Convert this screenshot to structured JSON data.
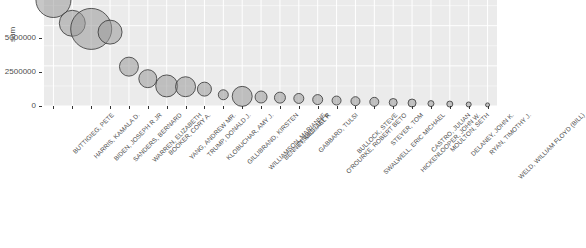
{
  "chart": {
    "type": "bubble",
    "ylabel": "sum",
    "xlabel": "",
    "title": "",
    "panel_bg": "#ebebeb",
    "grid_color": "#ffffff",
    "bubble_fill": "#999999",
    "bubble_stroke": "#333333",
    "text_color": "#4d4d4d"
  },
  "chart_data": {
    "type": "scatter",
    "title": "",
    "xlabel": "",
    "ylabel": "sum",
    "ylim": [
      0,
      6600000
    ],
    "yticks": [
      0,
      2500000,
      5000000
    ],
    "ytick_labels": [
      "0",
      "2500000",
      "5000000"
    ],
    "grid": true,
    "legend": "none",
    "note": "Bubble area encodes the same 'sum' value plotted on the y axis; candidates sorted descending.",
    "categories": [
      "BUTTIGIEG, PETE",
      "HARRIS, KAMALA D.",
      "BIDEN, JOSEPH R JR",
      "SANDERS, BERNARD",
      "WARREN, ELIZABETH",
      "BOOKER, CORY A.",
      "YANG, ANDREW MR.",
      "TRUMP, DONALD J.",
      "KLOBUCHAR, AMY J.",
      "GILLIBRAND, KIRSTEN",
      "WILLIAMSON, MARIANNE",
      "BENNET, MICHAEL F.",
      "INSLEE, JAY R",
      "GABBARD, TULSI",
      "O'ROURKE, ROBERT BETO",
      "BULLOCK, STEVE",
      "SWALWELL, ERIC MICHAEL",
      "STEYER, TOM",
      "HICKENLOOPER, JOHN W.",
      "CASTRO, JULIAN",
      "MOULTON, SETH",
      "DELANEY, JOHN K.",
      "RYAN, TIMOTHY J.",
      "WELD, WILLIAM FLOYD (BILL)"
    ],
    "values": [
      6600000,
      5150000,
      4800000,
      4600000,
      2450000,
      1700000,
      1250000,
      1200000,
      1050000,
      700000,
      600000,
      560000,
      520000,
      470000,
      400000,
      340000,
      300000,
      260000,
      220000,
      185000,
      150000,
      120000,
      95000,
      70000
    ],
    "bubble_radii_px": [
      17.5,
      13.0,
      20.5,
      12.0,
      9.5,
      9.0,
      11.0,
      10.0,
      7.0,
      5.0,
      10.0,
      6.0,
      5.5,
      5.0,
      5.0,
      4.5,
      4.5,
      4.5,
      4.0,
      4.0,
      3.0,
      3.0,
      2.5,
      2.0
    ]
  }
}
